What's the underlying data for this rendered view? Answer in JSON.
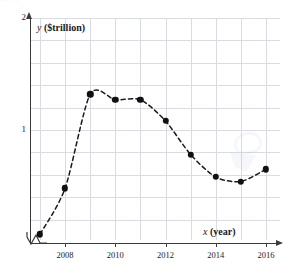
{
  "top_strip_text": "·   ·   ·                                   ·",
  "chart_data": {
    "type": "line",
    "title": "",
    "xlabel": "x (year)",
    "ylabel": "y ($trillion)",
    "ylabel_symbol": "y",
    "ylabel_unit": "($trillion)",
    "xlabel_symbol": "x",
    "xlabel_unit": "(year)",
    "x": [
      2007,
      2008,
      2009,
      2010,
      2011,
      2012,
      2013,
      2014,
      2015,
      2016
    ],
    "values": [
      0.07,
      0.48,
      1.32,
      1.27,
      1.27,
      1.08,
      0.78,
      0.58,
      0.54,
      0.65
    ],
    "series": [
      {
        "name": "y",
        "values": [
          0.07,
          0.48,
          1.32,
          1.27,
          1.27,
          1.08,
          0.78,
          0.58,
          0.54,
          0.65
        ]
      }
    ],
    "xlim": [
      2006.6,
      2016.4
    ],
    "ylim": [
      0.0,
      2.0
    ],
    "xticks": [
      2008,
      2010,
      2012,
      2014,
      2016
    ],
    "xtick_labels": [
      "2008",
      "2010",
      "2012",
      "2014",
      "2016"
    ],
    "yticks": [
      1,
      2
    ],
    "ytick_labels": [
      "1",
      "2"
    ],
    "grid": true,
    "grid_x_count": 10,
    "grid_y_step": 0.2,
    "legend": "none",
    "line_style": "dashed",
    "marker": "filled-circle",
    "axis_break": true,
    "colors": {
      "marker": "#111111",
      "line": "#1a1a1a",
      "grid": "#d9dde3",
      "axis": "#3a3a3a",
      "background": "#ffffff"
    }
  }
}
